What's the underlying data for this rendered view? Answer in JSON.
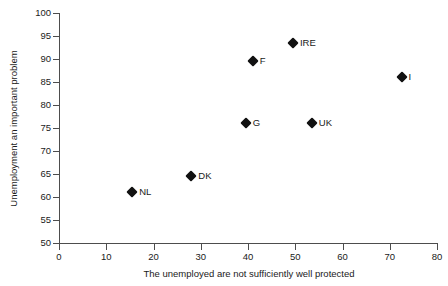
{
  "chart_data": {
    "type": "scatter",
    "title": "",
    "xlabel": "The unemployed are not sufficiently well protected",
    "ylabel": "Unemployment an important problem",
    "xlim": [
      0,
      80
    ],
    "ylim": [
      50,
      100
    ],
    "xticks": [
      0,
      10,
      20,
      30,
      40,
      50,
      60,
      70,
      80
    ],
    "yticks": [
      50,
      55,
      60,
      65,
      70,
      75,
      80,
      85,
      90,
      95,
      100
    ],
    "grid": false,
    "legend": false,
    "marker_shape": "diamond",
    "marker_color": "#111111",
    "points": [
      {
        "label": "NL",
        "x": 15.5,
        "y": 61.0
      },
      {
        "label": "DK",
        "x": 28.0,
        "y": 64.5
      },
      {
        "label": "G",
        "x": 39.5,
        "y": 76.0
      },
      {
        "label": "F",
        "x": 41.0,
        "y": 89.5
      },
      {
        "label": "IRE",
        "x": 49.5,
        "y": 93.5
      },
      {
        "label": "UK",
        "x": 53.5,
        "y": 76.0
      },
      {
        "label": "I",
        "x": 72.5,
        "y": 86.0
      }
    ]
  }
}
